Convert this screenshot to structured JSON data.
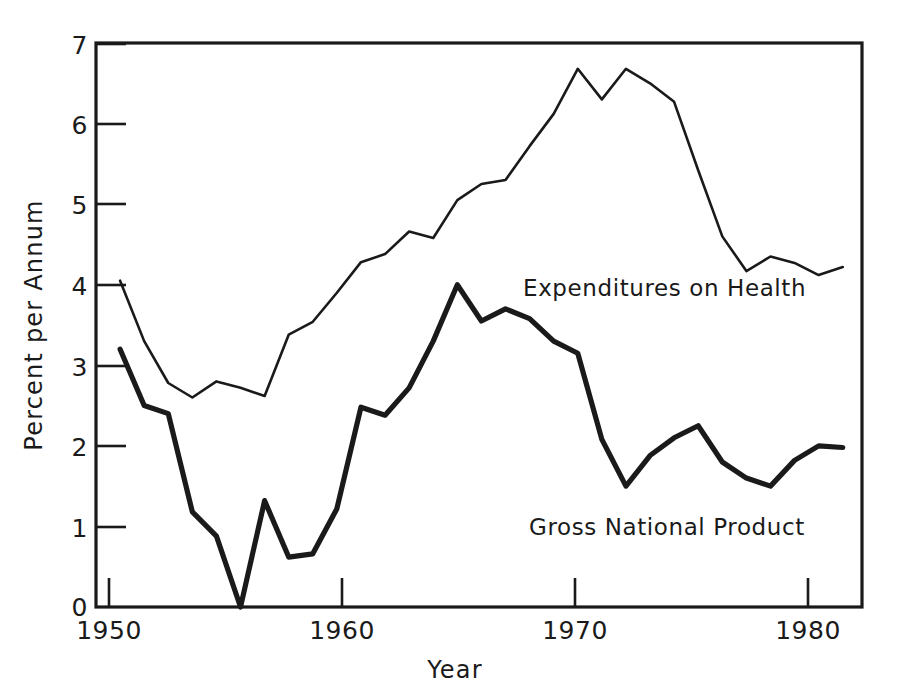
{
  "chart_data": {
    "type": "line",
    "title": "",
    "subtitle": "",
    "xlabel": "Year",
    "ylabel": "Percent per Annum",
    "xlim": [
      1950,
      1981.8
    ],
    "ylim": [
      0,
      7
    ],
    "xticks": [
      1950,
      1960,
      1970,
      1980
    ],
    "xtick_labels": [
      "1950",
      "1960",
      "1970",
      "1980"
    ],
    "yticks": [
      0,
      1,
      2,
      3,
      4,
      5,
      6,
      7
    ],
    "ytick_labels": [
      "0",
      "1",
      "2",
      "3",
      "4",
      "5",
      "6",
      "7"
    ],
    "grid": false,
    "legend_position": "inline-annotation",
    "x": [
      1951,
      1952,
      1953,
      1954,
      1955,
      1956,
      1957,
      1958,
      1959,
      1960,
      1961,
      1962,
      1963,
      1964,
      1965,
      1966,
      1967,
      1968,
      1969,
      1970,
      1971,
      1972,
      1973,
      1974,
      1975,
      1976,
      1977,
      1978,
      1979,
      1980,
      1981
    ],
    "series": [
      {
        "name": "Expenditures on Health",
        "style": "thin",
        "values": [
          4.05,
          3.3,
          2.78,
          2.6,
          2.8,
          2.72,
          2.62,
          3.38,
          3.54,
          3.9,
          4.28,
          4.38,
          4.66,
          4.58,
          5.05,
          5.25,
          5.3,
          5.72,
          6.12,
          6.68,
          6.3,
          6.68,
          6.5,
          6.27,
          5.42,
          4.6,
          4.17,
          4.35,
          4.27,
          4.12,
          4.22
        ]
      },
      {
        "name": "Gross National Product",
        "style": "thick",
        "values": [
          3.2,
          2.5,
          2.4,
          1.18,
          0.88,
          0.0,
          1.32,
          0.62,
          0.66,
          1.22,
          2.48,
          2.38,
          2.72,
          3.3,
          4.0,
          3.55,
          3.7,
          3.58,
          3.3,
          3.15,
          2.08,
          1.5,
          1.88,
          2.1,
          2.25,
          1.8,
          1.6,
          1.5,
          1.82,
          2.0,
          1.98
        ]
      }
    ],
    "series_annotations": [
      {
        "name": "Expenditures on Health",
        "x_px": 523,
        "y_px": 296
      },
      {
        "name": "Gross National Product",
        "x_px": 529,
        "y_px": 535
      }
    ]
  },
  "axes": {
    "x_title": "Year",
    "y_title": "Percent per Annum"
  },
  "colors": {
    "ink": "#1a1a1a",
    "background": "#ffffff"
  }
}
